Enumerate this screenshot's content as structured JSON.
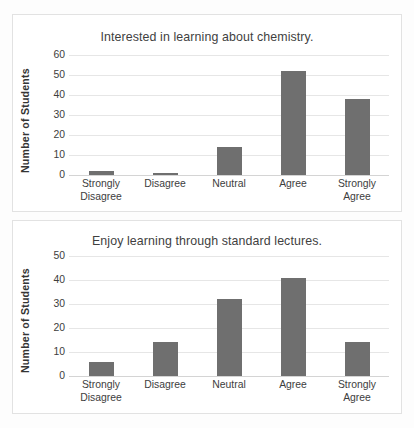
{
  "chart_data": [
    {
      "type": "bar",
      "id": "interest-chart",
      "title": "Interested in learning about chemistry.",
      "xlabel": "",
      "ylabel": "Number of Students",
      "categories": [
        "Strongly\nDisagree",
        "Disagree",
        "Neutral",
        "Agree",
        "Strongly\nAgree"
      ],
      "values": [
        2,
        1,
        14,
        52,
        38
      ],
      "ylim": [
        0,
        60
      ],
      "yticks": [
        0,
        10,
        20,
        30,
        40,
        50,
        60
      ],
      "grid": true,
      "legend": "none",
      "bar_color": "#6f6f6f"
    },
    {
      "type": "bar",
      "id": "lectures-chart",
      "title": "Enjoy learning through standard lectures.",
      "xlabel": "",
      "ylabel": "Number of Students",
      "categories": [
        "Strongly\nDisagree",
        "Disagree",
        "Neutral",
        "Agree",
        "Strongly\nAgree"
      ],
      "values": [
        6,
        14,
        32,
        41,
        14
      ],
      "ylim": [
        0,
        50
      ],
      "yticks": [
        0,
        10,
        20,
        30,
        40,
        50
      ],
      "grid": true,
      "legend": "none",
      "bar_color": "#6f6f6f"
    }
  ],
  "footer": {
    "caption": ""
  }
}
